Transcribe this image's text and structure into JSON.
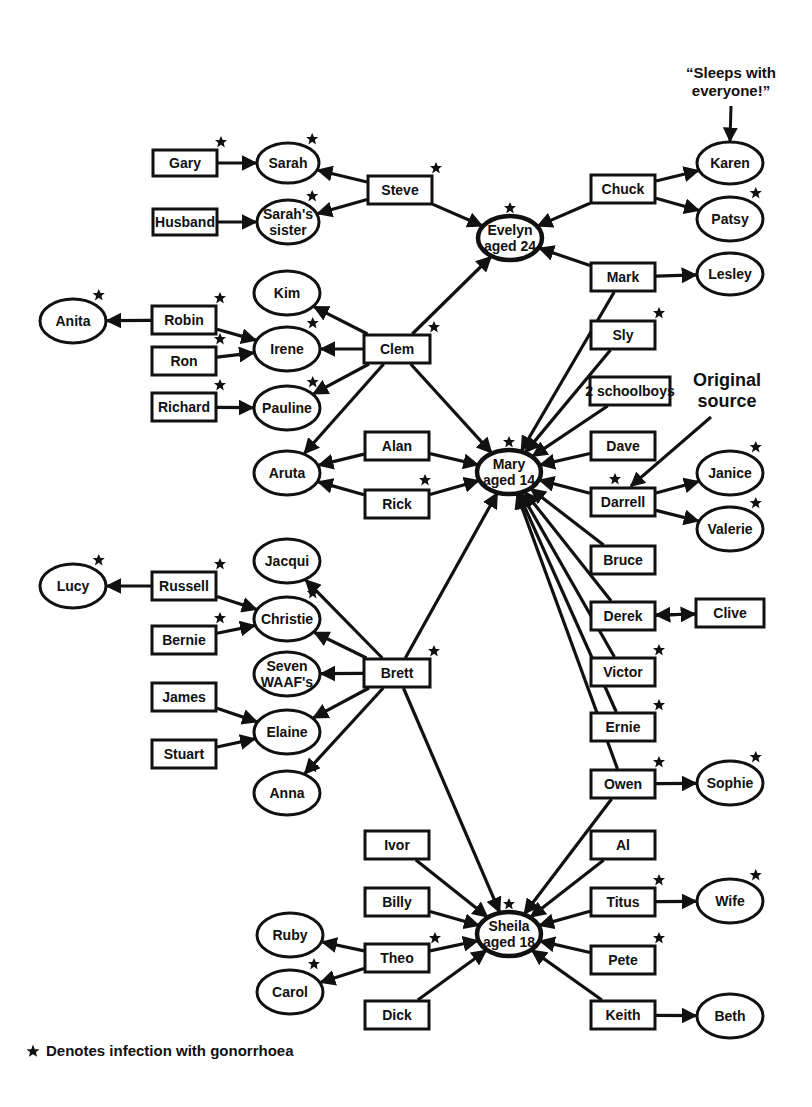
{
  "diagram": {
    "colors": {
      "stroke": "#111111",
      "fill": "#ffffff",
      "star": "#111111"
    },
    "nodes": [
      {
        "id": "gary",
        "label": "Gary",
        "shape": "rect",
        "x": 185,
        "y": 163,
        "w": 64,
        "h": 26,
        "infected": true
      },
      {
        "id": "sarah",
        "label": "Sarah",
        "shape": "ellipse",
        "x": 288,
        "y": 163,
        "w": 62,
        "h": 40,
        "infected": true
      },
      {
        "id": "husband",
        "label": "Husband",
        "shape": "rect",
        "x": 185,
        "y": 222,
        "w": 64,
        "h": 26,
        "infected": false
      },
      {
        "id": "sarahs_sister",
        "label": "Sarah's|sister",
        "shape": "ellipse",
        "x": 288,
        "y": 222,
        "w": 62,
        "h": 44,
        "infected": true
      },
      {
        "id": "steve",
        "label": "Steve",
        "shape": "rect",
        "x": 400,
        "y": 190,
        "w": 64,
        "h": 28,
        "infected": true
      },
      {
        "id": "evelyn",
        "label": "Evelyn|aged 24",
        "shape": "ellipse",
        "x": 510,
        "y": 238,
        "w": 64,
        "h": 44,
        "infected": true,
        "hub": true
      },
      {
        "id": "chuck",
        "label": "Chuck",
        "shape": "rect",
        "x": 623,
        "y": 189,
        "w": 64,
        "h": 28,
        "infected": false
      },
      {
        "id": "karen",
        "label": "Karen",
        "shape": "ellipse",
        "x": 730,
        "y": 163,
        "w": 66,
        "h": 42,
        "infected": false
      },
      {
        "id": "patsy",
        "label": "Patsy",
        "shape": "ellipse",
        "x": 730,
        "y": 219,
        "w": 66,
        "h": 44,
        "infected": true
      },
      {
        "id": "mark",
        "label": "Mark",
        "shape": "rect",
        "x": 623,
        "y": 277,
        "w": 64,
        "h": 28,
        "infected": false
      },
      {
        "id": "lesley",
        "label": "Lesley",
        "shape": "ellipse",
        "x": 730,
        "y": 274,
        "w": 66,
        "h": 42,
        "infected": false
      },
      {
        "id": "kim",
        "label": "Kim",
        "shape": "ellipse",
        "x": 287,
        "y": 293,
        "w": 66,
        "h": 44,
        "infected": false
      },
      {
        "id": "anita",
        "label": "Anita",
        "shape": "ellipse",
        "x": 73,
        "y": 321,
        "w": 66,
        "h": 44,
        "infected": true
      },
      {
        "id": "robin",
        "label": "Robin",
        "shape": "rect",
        "x": 184,
        "y": 320,
        "w": 64,
        "h": 28,
        "infected": true
      },
      {
        "id": "irene",
        "label": "Irene",
        "shape": "ellipse",
        "x": 287,
        "y": 349,
        "w": 66,
        "h": 44,
        "infected": true
      },
      {
        "id": "ron",
        "label": "Ron",
        "shape": "rect",
        "x": 184,
        "y": 361,
        "w": 64,
        "h": 28,
        "infected": true
      },
      {
        "id": "clem",
        "label": "Clem",
        "shape": "rect",
        "x": 397,
        "y": 349,
        "w": 66,
        "h": 28,
        "infected": true
      },
      {
        "id": "richard",
        "label": "Richard",
        "shape": "rect",
        "x": 184,
        "y": 407,
        "w": 64,
        "h": 28,
        "infected": true
      },
      {
        "id": "pauline",
        "label": "Pauline",
        "shape": "ellipse",
        "x": 287,
        "y": 408,
        "w": 66,
        "h": 44,
        "infected": true
      },
      {
        "id": "sly",
        "label": "Sly",
        "shape": "rect",
        "x": 623,
        "y": 335,
        "w": 64,
        "h": 28,
        "infected": true
      },
      {
        "id": "schoolboys",
        "label": "2 schoolboys",
        "shape": "rect",
        "x": 630,
        "y": 391,
        "w": 80,
        "h": 28,
        "infected": false
      },
      {
        "id": "alan",
        "label": "Alan",
        "shape": "rect",
        "x": 397,
        "y": 446,
        "w": 64,
        "h": 28,
        "infected": false
      },
      {
        "id": "aruta",
        "label": "Aruta",
        "shape": "ellipse",
        "x": 287,
        "y": 473,
        "w": 66,
        "h": 44,
        "infected": false
      },
      {
        "id": "mary",
        "label": "Mary|aged 14",
        "shape": "ellipse",
        "x": 509,
        "y": 472,
        "w": 64,
        "h": 44,
        "infected": true,
        "hub": true
      },
      {
        "id": "dave",
        "label": "Dave",
        "shape": "rect",
        "x": 623,
        "y": 446,
        "w": 64,
        "h": 28,
        "infected": false
      },
      {
        "id": "rick",
        "label": "Rick",
        "shape": "rect",
        "x": 397,
        "y": 504,
        "w": 64,
        "h": 28,
        "infected": true
      },
      {
        "id": "darrell",
        "label": "Darrell",
        "shape": "rect",
        "x": 623,
        "y": 502,
        "w": 64,
        "h": 28,
        "infected": true
      },
      {
        "id": "janice",
        "label": "Janice",
        "shape": "ellipse",
        "x": 730,
        "y": 473,
        "w": 66,
        "h": 44,
        "infected": true
      },
      {
        "id": "valerie",
        "label": "Valerie",
        "shape": "ellipse",
        "x": 730,
        "y": 529,
        "w": 66,
        "h": 44,
        "infected": true
      },
      {
        "id": "jacqui",
        "label": "Jacqui",
        "shape": "ellipse",
        "x": 287,
        "y": 561,
        "w": 66,
        "h": 44,
        "infected": false
      },
      {
        "id": "bruce",
        "label": "Bruce",
        "shape": "rect",
        "x": 623,
        "y": 560,
        "w": 64,
        "h": 28,
        "infected": false
      },
      {
        "id": "lucy",
        "label": "Lucy",
        "shape": "ellipse",
        "x": 73,
        "y": 586,
        "w": 66,
        "h": 44,
        "infected": true
      },
      {
        "id": "russell",
        "label": "Russell",
        "shape": "rect",
        "x": 184,
        "y": 586,
        "w": 64,
        "h": 28,
        "infected": true
      },
      {
        "id": "christie",
        "label": "Christie",
        "shape": "ellipse",
        "x": 287,
        "y": 619,
        "w": 66,
        "h": 44,
        "infected": true
      },
      {
        "id": "derek",
        "label": "Derek",
        "shape": "rect",
        "x": 623,
        "y": 616,
        "w": 64,
        "h": 28,
        "infected": false
      },
      {
        "id": "clive",
        "label": "Clive",
        "shape": "rect",
        "x": 730,
        "y": 613,
        "w": 68,
        "h": 28,
        "infected": false
      },
      {
        "id": "bernie",
        "label": "Bernie",
        "shape": "rect",
        "x": 184,
        "y": 640,
        "w": 64,
        "h": 28,
        "infected": true
      },
      {
        "id": "brett",
        "label": "Brett",
        "shape": "rect",
        "x": 397,
        "y": 673,
        "w": 66,
        "h": 28,
        "infected": true
      },
      {
        "id": "seven_waafs",
        "label": "Seven|WAAF's",
        "shape": "ellipse",
        "x": 287,
        "y": 674,
        "w": 66,
        "h": 44,
        "infected": false
      },
      {
        "id": "victor",
        "label": "Victor",
        "shape": "rect",
        "x": 623,
        "y": 672,
        "w": 64,
        "h": 28,
        "infected": true
      },
      {
        "id": "james",
        "label": "James",
        "shape": "rect",
        "x": 184,
        "y": 697,
        "w": 64,
        "h": 28,
        "infected": false
      },
      {
        "id": "elaine",
        "label": "Elaine",
        "shape": "ellipse",
        "x": 287,
        "y": 732,
        "w": 66,
        "h": 44,
        "infected": false
      },
      {
        "id": "ernie",
        "label": "Ernie",
        "shape": "rect",
        "x": 623,
        "y": 727,
        "w": 64,
        "h": 28,
        "infected": true
      },
      {
        "id": "stuart",
        "label": "Stuart",
        "shape": "rect",
        "x": 184,
        "y": 754,
        "w": 64,
        "h": 28,
        "infected": false
      },
      {
        "id": "anna",
        "label": "Anna",
        "shape": "ellipse",
        "x": 287,
        "y": 793,
        "w": 66,
        "h": 44,
        "infected": true
      },
      {
        "id": "owen",
        "label": "Owen",
        "shape": "rect",
        "x": 623,
        "y": 784,
        "w": 64,
        "h": 28,
        "infected": true
      },
      {
        "id": "sophie",
        "label": "Sophie",
        "shape": "ellipse",
        "x": 730,
        "y": 783,
        "w": 66,
        "h": 44,
        "infected": true
      },
      {
        "id": "ivor",
        "label": "Ivor",
        "shape": "rect",
        "x": 397,
        "y": 845,
        "w": 64,
        "h": 28,
        "infected": false
      },
      {
        "id": "al",
        "label": "Al",
        "shape": "rect",
        "x": 623,
        "y": 845,
        "w": 64,
        "h": 28,
        "infected": false
      },
      {
        "id": "billy",
        "label": "Billy",
        "shape": "rect",
        "x": 397,
        "y": 902,
        "w": 64,
        "h": 28,
        "infected": false
      },
      {
        "id": "titus",
        "label": "Titus",
        "shape": "rect",
        "x": 623,
        "y": 902,
        "w": 64,
        "h": 28,
        "infected": true
      },
      {
        "id": "wife",
        "label": "Wife",
        "shape": "ellipse",
        "x": 730,
        "y": 901,
        "w": 66,
        "h": 44,
        "infected": true
      },
      {
        "id": "ruby",
        "label": "Ruby",
        "shape": "ellipse",
        "x": 290,
        "y": 935,
        "w": 66,
        "h": 44,
        "infected": false
      },
      {
        "id": "sheila",
        "label": "Sheila|aged 18",
        "shape": "ellipse",
        "x": 509,
        "y": 934,
        "w": 64,
        "h": 44,
        "infected": true,
        "hub": true
      },
      {
        "id": "theo",
        "label": "Theo",
        "shape": "rect",
        "x": 397,
        "y": 958,
        "w": 64,
        "h": 28,
        "infected": true
      },
      {
        "id": "pete",
        "label": "Pete",
        "shape": "rect",
        "x": 623,
        "y": 960,
        "w": 64,
        "h": 28,
        "infected": true
      },
      {
        "id": "carol",
        "label": "Carol",
        "shape": "ellipse",
        "x": 290,
        "y": 992,
        "w": 66,
        "h": 44,
        "infected": true
      },
      {
        "id": "dick",
        "label": "Dick",
        "shape": "rect",
        "x": 397,
        "y": 1015,
        "w": 64,
        "h": 28,
        "infected": false
      },
      {
        "id": "keith",
        "label": "Keith",
        "shape": "rect",
        "x": 623,
        "y": 1015,
        "w": 64,
        "h": 28,
        "infected": false
      },
      {
        "id": "beth",
        "label": "Beth",
        "shape": "ellipse",
        "x": 730,
        "y": 1016,
        "w": 66,
        "h": 44,
        "infected": false
      }
    ],
    "edges": [
      [
        "gary",
        "sarah"
      ],
      [
        "husband",
        "sarahs_sister"
      ],
      [
        "steve",
        "sarah"
      ],
      [
        "steve",
        "sarahs_sister"
      ],
      [
        "steve",
        "evelyn"
      ],
      [
        "chuck",
        "evelyn"
      ],
      [
        "chuck",
        "karen"
      ],
      [
        "chuck",
        "patsy"
      ],
      [
        "mark",
        "evelyn"
      ],
      [
        "mark",
        "lesley"
      ],
      [
        "mark",
        "mary"
      ],
      [
        "clem",
        "evelyn"
      ],
      [
        "clem",
        "kim"
      ],
      [
        "clem",
        "irene"
      ],
      [
        "clem",
        "pauline"
      ],
      [
        "clem",
        "aruta"
      ],
      [
        "clem",
        "mary"
      ],
      [
        "robin",
        "anita"
      ],
      [
        "robin",
        "irene"
      ],
      [
        "ron",
        "irene"
      ],
      [
        "richard",
        "pauline"
      ],
      [
        "alan",
        "aruta"
      ],
      [
        "alan",
        "mary"
      ],
      [
        "rick",
        "aruta"
      ],
      [
        "rick",
        "mary"
      ],
      [
        "sly",
        "mary"
      ],
      [
        "schoolboys",
        "mary"
      ],
      [
        "dave",
        "mary"
      ],
      [
        "darrell",
        "mary"
      ],
      [
        "darrell",
        "janice"
      ],
      [
        "darrell",
        "valerie"
      ],
      [
        "bruce",
        "mary"
      ],
      [
        "derek",
        "mary"
      ],
      [
        "derek",
        "clive"
      ],
      [
        "clive",
        "derek"
      ],
      [
        "victor",
        "mary"
      ],
      [
        "ernie",
        "mary"
      ],
      [
        "owen",
        "mary"
      ],
      [
        "owen",
        "sophie"
      ],
      [
        "owen",
        "sheila"
      ],
      [
        "brett",
        "mary"
      ],
      [
        "brett",
        "jacqui"
      ],
      [
        "brett",
        "christie"
      ],
      [
        "brett",
        "seven_waafs"
      ],
      [
        "brett",
        "elaine"
      ],
      [
        "brett",
        "anna"
      ],
      [
        "brett",
        "sheila"
      ],
      [
        "russell",
        "lucy"
      ],
      [
        "russell",
        "christie"
      ],
      [
        "bernie",
        "christie"
      ],
      [
        "james",
        "elaine"
      ],
      [
        "stuart",
        "elaine"
      ],
      [
        "ivor",
        "sheila"
      ],
      [
        "billy",
        "sheila"
      ],
      [
        "theo",
        "sheila"
      ],
      [
        "theo",
        "ruby"
      ],
      [
        "theo",
        "carol"
      ],
      [
        "dick",
        "sheila"
      ],
      [
        "al",
        "sheila"
      ],
      [
        "titus",
        "sheila"
      ],
      [
        "titus",
        "wife"
      ],
      [
        "pete",
        "sheila"
      ],
      [
        "keith",
        "sheila"
      ],
      [
        "keith",
        "beth"
      ]
    ],
    "annotations": [
      {
        "id": "sleeps_note",
        "lines": [
          "“Sleeps with",
          "everyone!”"
        ],
        "x": 731,
        "y": 78,
        "size": 15,
        "arrow_to": "karen"
      },
      {
        "id": "original_source",
        "lines": [
          "Original",
          "source"
        ],
        "x": 727,
        "y": 386,
        "size": 18,
        "arrow_to": "darrell"
      }
    ]
  },
  "legend": {
    "icon": "star-icon",
    "text": "Denotes infection with gonorrhoea"
  }
}
